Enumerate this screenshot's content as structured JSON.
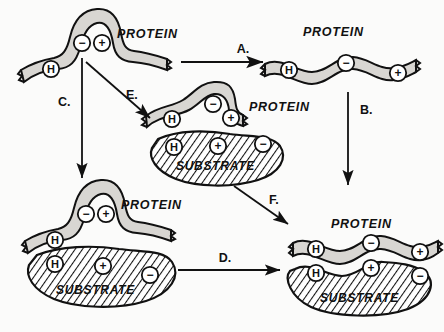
{
  "figure": {
    "type": "diagram",
    "background_color": "#fbfbfa",
    "ink_color": "#111111",
    "protein_fill": "#d8d6d2",
    "substrate_fill": "#ffffff",
    "substrate_hatch": "diagonal-line-hatching"
  },
  "labels": {
    "protein": "PROTEIN",
    "substrate": "SUBSTRATE",
    "charge_negative": "−",
    "charge_positive": "+",
    "charge_hydrogen": "H"
  },
  "nodes": [
    {
      "id": "native-protein",
      "name": "native-folded-protein",
      "title": "PROTEIN",
      "position": "top-left",
      "state": "native-folded",
      "bound_to_substrate": false,
      "charges": [
        "H",
        "−",
        "+"
      ]
    },
    {
      "id": "denatured-protein",
      "name": "denatured-unfolded-protein",
      "title": "PROTEIN",
      "position": "top-right",
      "state": "denatured-unfolded",
      "bound_to_substrate": false,
      "charges": [
        "H",
        "−",
        "+"
      ]
    },
    {
      "id": "denatured-plus-substrate",
      "name": "denatured-protein-above-substrate",
      "title": "PROTEIN",
      "substrate_title": "SUBSTRATE",
      "position": "center",
      "state": "denatured-unbound-near-substrate",
      "bound_to_substrate": false,
      "protein_charges": [
        "H",
        "−",
        "+"
      ],
      "substrate_charges": [
        "H",
        "+",
        "−"
      ]
    },
    {
      "id": "native-on-substrate",
      "name": "native-protein-on-substrate",
      "title": "PROTEIN",
      "substrate_title": "SUBSTRATE",
      "position": "bottom-left",
      "state": "native-folded-on-substrate",
      "bound_to_substrate": true,
      "protein_charges": [
        "H",
        "−",
        "+"
      ],
      "substrate_charges": [
        "H",
        "+",
        "−"
      ]
    },
    {
      "id": "denatured-bound-substrate",
      "name": "denatured-protein-bound-to-substrate",
      "title": "PROTEIN",
      "substrate_title": "SUBSTRATE",
      "position": "bottom-right",
      "state": "denatured-bound-complementary",
      "bound_to_substrate": true,
      "protein_charges": [
        "H",
        "−",
        "+"
      ],
      "substrate_charges": [
        "H",
        "+",
        "−"
      ]
    }
  ],
  "arrows": [
    {
      "id": "A",
      "label": "A.",
      "from": "native-protein",
      "to": "denatured-protein",
      "direction": "right",
      "label_x": 243,
      "label_y": 53
    },
    {
      "id": "B",
      "label": "B.",
      "from": "denatured-protein",
      "to": "denatured-bound-substrate",
      "direction": "down",
      "label_x": 360,
      "label_y": 108
    },
    {
      "id": "C",
      "label": "C.",
      "from": "native-protein",
      "to": "native-on-substrate",
      "direction": "down",
      "label_x": 64,
      "label_y": 100
    },
    {
      "id": "D",
      "label": "D.",
      "from": "native-on-substrate",
      "to": "denatured-bound-substrate",
      "direction": "right",
      "label_x": 225,
      "label_y": 258
    },
    {
      "id": "E",
      "label": "E.",
      "from": "native-protein",
      "to": "denatured-plus-substrate",
      "direction": "down-right",
      "label_x": 133,
      "label_y": 96
    },
    {
      "id": "F",
      "label": "F.",
      "from": "denatured-plus-substrate",
      "to": "denatured-bound-substrate",
      "direction": "down-right",
      "label_x": 273,
      "label_y": 200
    }
  ]
}
